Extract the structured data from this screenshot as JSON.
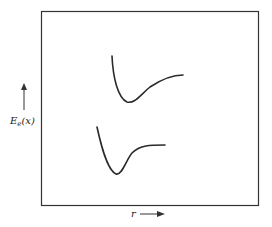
{
  "diagram": {
    "type": "potential-energy-curves",
    "y_axis_label": {
      "main": "E",
      "subscript": "e",
      "arg": "(x)"
    },
    "x_axis_label": "r",
    "curves": [
      {
        "name": "upper-state-curve",
        "path": "M112,56 C113,78 118,98 127,102 C135,104 140,95 150,87 C162,79 172,75 183,75"
      },
      {
        "name": "ground-state-curve",
        "path": "M97,127 C101,145 107,170 116,174 C122,176 126,160 132,153 C140,145 150,145 165,145"
      }
    ],
    "stroke_color": "#2a2a2a",
    "frame_color": "#333333"
  }
}
